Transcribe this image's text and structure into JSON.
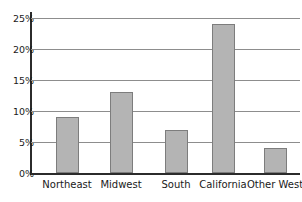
{
  "chart_data": {
    "type": "bar",
    "title": "",
    "subtitle": "",
    "xlabel": "",
    "ylabel": "",
    "categories": [
      "Northeast",
      "Midwest",
      "South",
      "California",
      "Other West"
    ],
    "values": [
      9,
      13,
      7,
      24,
      4
    ],
    "ylim": [
      0,
      25
    ],
    "ytick_values": [
      0,
      5,
      10,
      15,
      20,
      25
    ],
    "ytick_labels": [
      "0%",
      "5%",
      "10%",
      "15%",
      "20%",
      "25%"
    ],
    "grid": true,
    "legend": null,
    "series": [
      {
        "name": "",
        "values": [
          9,
          13,
          7,
          24,
          4
        ]
      }
    ],
    "colors": {
      "bar_fill": "#b4b4b4",
      "bar_border": "#7d7d7d",
      "gridline": "#8d8d8d",
      "axis": "#2b2b2b",
      "background": "#ffffff",
      "text": "#1a1a1a"
    }
  }
}
